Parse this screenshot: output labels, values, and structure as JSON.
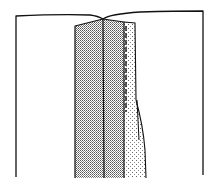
{
  "diagram": {
    "type": "sewing-illustration",
    "colors": {
      "background": "#ffffff",
      "ink": "#111111",
      "dense_dot": "#555555",
      "light_dot": "#777777"
    },
    "parts": [
      {
        "id": "outer-garment",
        "label": ""
      },
      {
        "id": "left-placket-panel",
        "label": ""
      },
      {
        "id": "center-fold",
        "label": ""
      },
      {
        "id": "stitching-line",
        "label": ""
      },
      {
        "id": "underlap-facing",
        "label": ""
      }
    ]
  }
}
